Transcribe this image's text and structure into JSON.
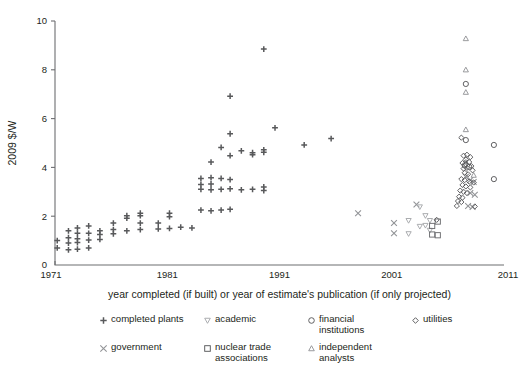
{
  "chart_data": {
    "type": "scatter",
    "title": "",
    "xlabel": "year completed (if built) or year of estimate's publication (if only projected)",
    "ylabel": "2009 $/W",
    "xlim": [
      1971,
      2011
    ],
    "ylim": [
      0,
      10
    ],
    "xticks": [
      1971,
      1981,
      1991,
      2001,
      2011
    ],
    "xtick_labels": [
      "1971",
      "1981",
      "1991",
      "2001",
      "2011"
    ],
    "yticks": [
      0,
      2,
      4,
      6,
      8,
      10
    ],
    "ytick_labels": [
      "0",
      "2",
      "4",
      "6",
      "8",
      "10"
    ],
    "grid": false,
    "legend_position": "below",
    "series": [
      {
        "name": "completed plants",
        "marker": "plus",
        "color": "#58595b",
        "points": [
          [
            1971.2,
            0.7
          ],
          [
            1971.2,
            1.0
          ],
          [
            1972.2,
            0.62
          ],
          [
            1972.2,
            0.9
          ],
          [
            1972.2,
            1.12
          ],
          [
            1972.2,
            1.4
          ],
          [
            1973.0,
            0.65
          ],
          [
            1973.0,
            0.92
          ],
          [
            1973.0,
            1.08
          ],
          [
            1973.0,
            1.3
          ],
          [
            1973.0,
            1.52
          ],
          [
            1974.0,
            0.7
          ],
          [
            1974.0,
            1.02
          ],
          [
            1974.0,
            1.3
          ],
          [
            1974.0,
            1.6
          ],
          [
            1975.0,
            1.05
          ],
          [
            1975.0,
            1.25
          ],
          [
            1975.0,
            1.4
          ],
          [
            1976.2,
            1.45
          ],
          [
            1976.2,
            1.72
          ],
          [
            1976.2,
            1.28
          ],
          [
            1977.4,
            1.4
          ],
          [
            1977.4,
            1.92
          ],
          [
            1977.4,
            2.02
          ],
          [
            1978.6,
            1.45
          ],
          [
            1978.6,
            1.72
          ],
          [
            1978.6,
            2.02
          ],
          [
            1978.6,
            2.12
          ],
          [
            1980.2,
            1.48
          ],
          [
            1980.2,
            1.72
          ],
          [
            1981.2,
            1.5
          ],
          [
            1981.2,
            1.98
          ],
          [
            1981.2,
            2.12
          ],
          [
            1982.2,
            1.55
          ],
          [
            1983.2,
            1.52
          ],
          [
            1984.0,
            2.25
          ],
          [
            1984.0,
            3.1
          ],
          [
            1984.0,
            3.3
          ],
          [
            1984.0,
            3.55
          ],
          [
            1984.9,
            2.22
          ],
          [
            1984.9,
            3.08
          ],
          [
            1984.9,
            3.32
          ],
          [
            1984.9,
            3.58
          ],
          [
            1984.9,
            4.22
          ],
          [
            1985.8,
            2.25
          ],
          [
            1985.8,
            3.1
          ],
          [
            1985.8,
            3.55
          ],
          [
            1985.8,
            4.82
          ],
          [
            1986.6,
            2.28
          ],
          [
            1986.6,
            3.12
          ],
          [
            1986.6,
            3.5
          ],
          [
            1986.6,
            4.48
          ],
          [
            1986.6,
            5.38
          ],
          [
            1986.6,
            6.92
          ],
          [
            1987.6,
            3.08
          ],
          [
            1987.6,
            4.68
          ],
          [
            1988.6,
            3.1
          ],
          [
            1988.6,
            4.6
          ],
          [
            1988.6,
            4.52
          ],
          [
            1989.6,
            3.05
          ],
          [
            1989.6,
            3.2
          ],
          [
            1989.6,
            4.62
          ],
          [
            1989.6,
            4.72
          ],
          [
            1989.6,
            8.85
          ],
          [
            1990.6,
            5.62
          ],
          [
            1993.2,
            4.92
          ],
          [
            1995.6,
            5.18
          ]
        ]
      },
      {
        "name": "government",
        "marker": "x",
        "color": "#939598",
        "points": [
          [
            1998.0,
            2.12
          ],
          [
            2001.2,
            1.72
          ],
          [
            2001.2,
            1.3
          ],
          [
            2003.2,
            2.48
          ],
          [
            2007.6,
            3.62
          ],
          [
            2008.0,
            3.48
          ],
          [
            2008.3,
            3.4
          ],
          [
            2008.0,
            2.95
          ],
          [
            2008.4,
            2.88
          ],
          [
            2007.8,
            2.42
          ],
          [
            2008.2,
            2.38
          ]
        ]
      },
      {
        "name": "academic",
        "marker": "triangle-down",
        "color": "#a7a9ac",
        "points": [
          [
            2003.5,
            2.38
          ],
          [
            2002.5,
            1.82
          ],
          [
            2002.5,
            1.28
          ],
          [
            2004.0,
            2.02
          ],
          [
            2004.0,
            1.62
          ],
          [
            2004.4,
            1.82
          ],
          [
            2004.4,
            1.42
          ],
          [
            2003.5,
            1.58
          ]
        ]
      },
      {
        "name": "nuclear trade associations",
        "marker": "square",
        "color": "#6d6e71",
        "points": [
          [
            2004.6,
            1.6
          ],
          [
            2005.1,
            1.78
          ],
          [
            2004.6,
            1.25
          ],
          [
            2005.1,
            1.22
          ]
        ]
      },
      {
        "name": "financial institutions",
        "marker": "circle",
        "color": "#58595b",
        "points": [
          [
            2007.6,
            7.42
          ],
          [
            2007.6,
            5.12
          ],
          [
            2010.1,
            4.92
          ],
          [
            2010.1,
            3.52
          ],
          [
            2007.5,
            4.08
          ],
          [
            2007.9,
            4.02
          ]
        ]
      },
      {
        "name": "independent analysts",
        "marker": "triangle-up",
        "color": "#939598",
        "points": [
          [
            2007.6,
            9.28
          ],
          [
            2007.6,
            8.0
          ],
          [
            2007.6,
            7.08
          ],
          [
            2007.6,
            5.55
          ],
          [
            2008.3,
            3.68
          ],
          [
            2007.6,
            4.22
          ]
        ]
      },
      {
        "name": "utilities",
        "marker": "diamond",
        "color": "#58595b",
        "points": [
          [
            2007.2,
            5.22
          ],
          [
            2007.4,
            4.48
          ],
          [
            2007.7,
            4.52
          ],
          [
            2008.0,
            4.42
          ],
          [
            2007.6,
            4.32
          ],
          [
            2007.3,
            4.18
          ],
          [
            2007.6,
            4.12
          ],
          [
            2007.9,
            4.22
          ],
          [
            2008.1,
            4.05
          ],
          [
            2007.4,
            3.95
          ],
          [
            2007.7,
            3.98
          ],
          [
            2008.2,
            3.88
          ],
          [
            2007.5,
            3.78
          ],
          [
            2007.8,
            3.72
          ],
          [
            2007.2,
            3.52
          ],
          [
            2007.5,
            3.48
          ],
          [
            2007.9,
            3.42
          ],
          [
            2008.3,
            3.38
          ],
          [
            2007.3,
            3.28
          ],
          [
            2007.6,
            3.22
          ],
          [
            2008.0,
            3.18
          ],
          [
            2007.1,
            3.05
          ],
          [
            2007.4,
            3.0
          ],
          [
            2007.7,
            2.95
          ],
          [
            2007.0,
            2.8
          ],
          [
            2007.3,
            2.76
          ],
          [
            2006.9,
            2.62
          ],
          [
            2007.2,
            2.58
          ],
          [
            2006.8,
            2.42
          ],
          [
            2008.4,
            2.4
          ],
          [
            2005.0,
            1.85
          ]
        ]
      }
    ]
  },
  "legend": {
    "entries": [
      {
        "marker": "plus",
        "label": "completed plants"
      },
      {
        "marker": "triangle-down",
        "label": "academic"
      },
      {
        "marker": "circle",
        "label": "financial\ninstitutions"
      },
      {
        "marker": "diamond",
        "label": "utilities"
      },
      {
        "marker": "x",
        "label": "government"
      },
      {
        "marker": "square",
        "label": "nuclear trade\nassociations"
      },
      {
        "marker": "triangle-up",
        "label": "independent\nanalysts"
      }
    ]
  },
  "colors": {
    "axis": "#6d6e71",
    "text": "#231f20",
    "dark_marker": "#58595b",
    "mid_marker": "#939598",
    "light_marker": "#a7a9ac"
  }
}
